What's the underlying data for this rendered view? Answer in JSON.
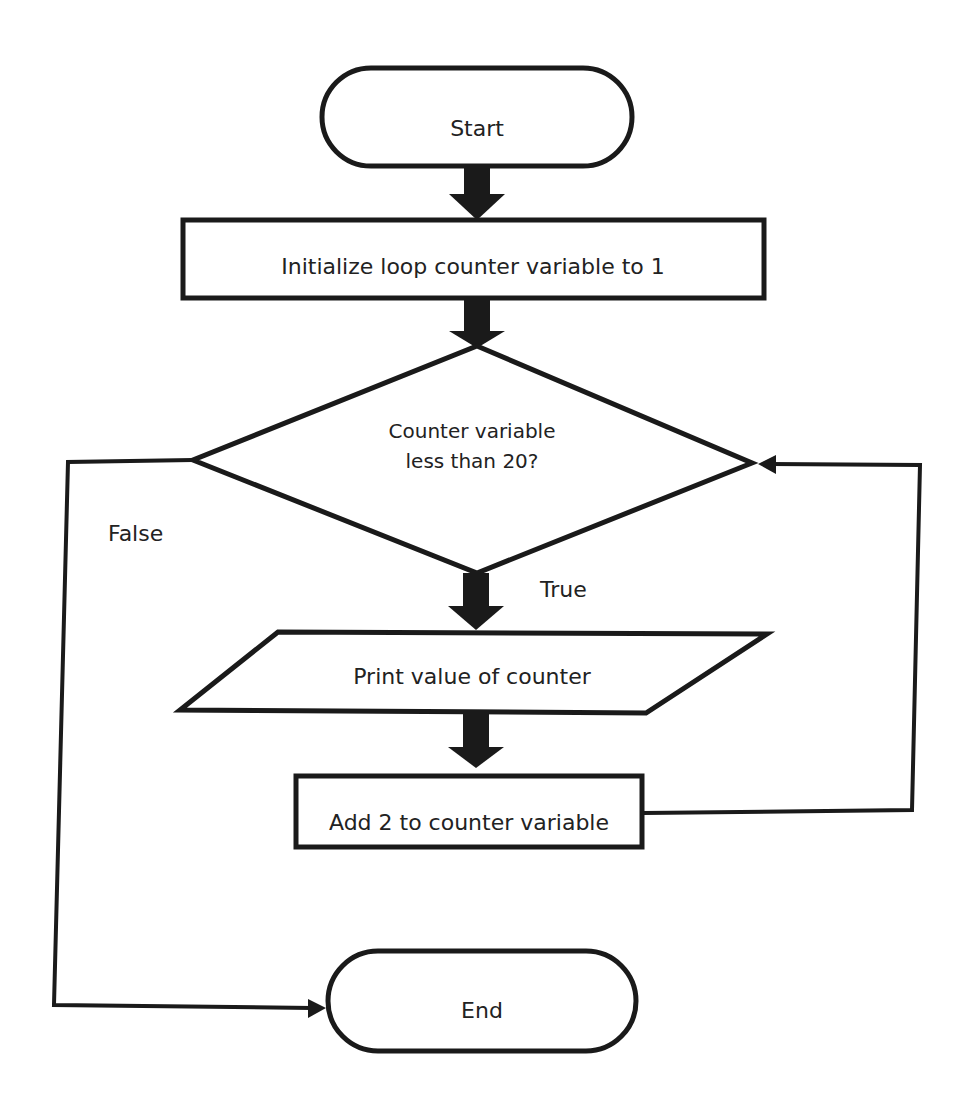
{
  "diagram": {
    "type": "flowchart",
    "nodes": {
      "start": {
        "shape": "terminator",
        "label": "Start"
      },
      "init": {
        "shape": "process",
        "label": "Initialize loop counter variable to 1"
      },
      "decision": {
        "shape": "decision",
        "line1": "Counter variable",
        "line2": "less than 20?"
      },
      "print": {
        "shape": "input-output",
        "label": "Print value of counter"
      },
      "add": {
        "shape": "process",
        "label": "Add 2 to counter variable"
      },
      "end": {
        "shape": "terminator",
        "label": "End"
      }
    },
    "edges": {
      "true_label": "True",
      "false_label": "False"
    },
    "colors": {
      "stroke": "#1a1a1a",
      "fill": "#ffffff",
      "text": "#222222"
    }
  }
}
